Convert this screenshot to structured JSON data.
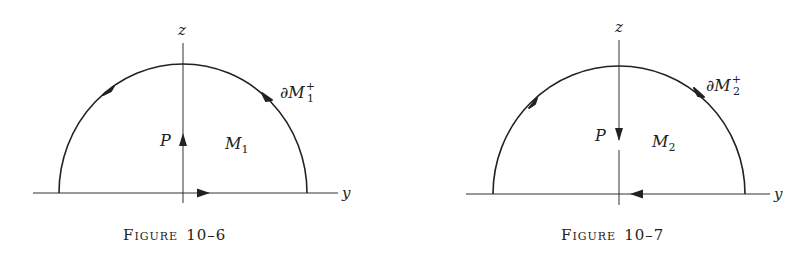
{
  "figures": [
    {
      "id": "fig-10-6",
      "caption_word": "Figure",
      "caption_first": "F",
      "caption_rest": "IGURE",
      "caption_number": "10–6",
      "axis_vertical": "z",
      "axis_horizontal": "y",
      "point_label": "P",
      "point_arrow": "up",
      "region_label": "M",
      "region_sub": "1",
      "boundary_label": "∂M",
      "boundary_sub": "1",
      "boundary_sup": "+",
      "orientation": "counterclockwise"
    },
    {
      "id": "fig-10-7",
      "caption_word": "Figure",
      "caption_first": "F",
      "caption_rest": "IGURE",
      "caption_number": "10–7",
      "axis_vertical": "z",
      "axis_horizontal": "y",
      "point_label": "P",
      "point_arrow": "down",
      "region_label": "M",
      "region_sub": "2",
      "boundary_label": "∂M",
      "boundary_sub": "2",
      "boundary_sup": "+",
      "orientation": "clockwise"
    }
  ],
  "colors": {
    "ink": "#222222",
    "background": "#ffffff"
  }
}
